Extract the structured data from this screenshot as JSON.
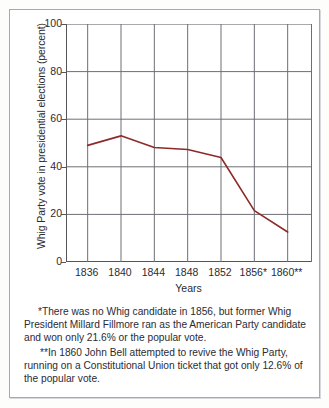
{
  "chart_data": {
    "type": "line",
    "title": "",
    "xlabel": "Years",
    "ylabel": "Whig Party vote in presidential elections (percent)",
    "categories": [
      "1836",
      "1840",
      "1844",
      "1848",
      "1852",
      "1856*",
      "1860**"
    ],
    "x": [
      1836,
      1840,
      1844,
      1848,
      1852,
      1856,
      1860
    ],
    "values": [
      49.0,
      53.0,
      48.1,
      47.3,
      43.9,
      21.6,
      12.6
    ],
    "series": [
      {
        "name": "Whig Party vote",
        "values": [
          49.0,
          53.0,
          48.1,
          47.3,
          43.9,
          21.6,
          12.6
        ],
        "color": "#8c2b28"
      }
    ],
    "ylim": [
      0,
      100
    ],
    "yticks": [
      0,
      20,
      40,
      60,
      80,
      100
    ],
    "ytick_labels": [
      "0",
      "20",
      "40",
      "60",
      "80",
      "100"
    ],
    "grid": true,
    "grid_axis": "both",
    "legend": false,
    "legend_position": "none",
    "line_color": "#8c2b28",
    "grid_color": "#6e6e76",
    "axis_color": "#55555c",
    "background": "#ffffff",
    "annotations": [
      "*There was no Whig candidate in 1856, but former Whig President Millard Fillmore ran as the American Party candidate and won only 21.6% or the popular vote.",
      "**In 1860 John Bell attempted to revive the Whig Party, running on a Constitutional Union ticket that got only 12.6% of the popular vote."
    ]
  },
  "axes": {
    "y_title": "Whig Party vote in presidential elections (percent)",
    "x_title": "Years",
    "y_ticks": [
      "100",
      "80",
      "60",
      "40",
      "20",
      "0"
    ],
    "x_ticks": [
      "1836",
      "1840",
      "1844",
      "1848",
      "1852",
      "1856*",
      "1860**"
    ]
  },
  "footnotes": {
    "first": "*There was no Whig candidate in 1856, but former Whig President Millard Fillmore ran as the American Party candidate and won only 21.6% or the popular vote.",
    "second": "**In 1860 John Bell attempted to revive the Whig Party, running on a Constitutional Union ticket that got only 12.6% of the popular vote."
  }
}
